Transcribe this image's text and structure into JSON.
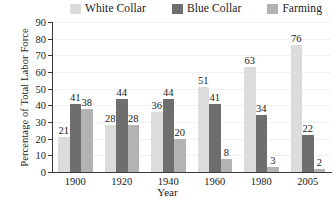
{
  "chart_data": {
    "type": "bar",
    "title": "",
    "subtitle": "",
    "xlabel": "Year",
    "ylabel": "Percentage of Total Labor Force",
    "categories": [
      "1900",
      "1920",
      "1940",
      "1960",
      "1980",
      "2005"
    ],
    "series": [
      {
        "name": "White Collar",
        "color": "#dcdcdc",
        "values": [
          21,
          28,
          36,
          51,
          63,
          76
        ]
      },
      {
        "name": "Blue Collar",
        "color": "#6e6e6e",
        "values": [
          41,
          44,
          44,
          41,
          34,
          22
        ]
      },
      {
        "name": "Farming",
        "color": "#b3b3b3",
        "values": [
          38,
          28,
          20,
          8,
          3,
          2
        ]
      }
    ],
    "ylim": [
      0,
      90
    ],
    "yticks": [
      0,
      10,
      20,
      30,
      40,
      50,
      60,
      70,
      80,
      90
    ],
    "ytick_labels": [
      "0",
      "10",
      "20",
      "30",
      "40",
      "50",
      "60",
      "70",
      "80",
      "90"
    ],
    "grid": true,
    "legend_position": "top",
    "data_labels": true
  },
  "legend": {
    "entries": [
      {
        "label": "White Collar",
        "swatch": "#dcdcdc"
      },
      {
        "label": "Blue Collar",
        "swatch": "#6e6e6e"
      },
      {
        "label": "Farming",
        "swatch": "#b3b3b3"
      }
    ]
  },
  "axes": {
    "y_title": "Percentage of Total Labor Force",
    "x_title": "Year"
  },
  "colors": {
    "axis": "#3b3b3b",
    "grid": "#f1f1f1",
    "background": "#ffffff",
    "text": "#1a1a1a"
  }
}
